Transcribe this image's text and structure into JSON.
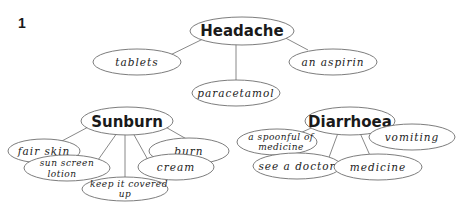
{
  "exercise_number": "1",
  "hubs": {
    "headache": {
      "label": "Headache",
      "leaves": [
        "tablets",
        "paracetamol",
        "an aspirin"
      ]
    },
    "sunburn": {
      "label": "Sunburn",
      "leaves": [
        "fair skin",
        "burn",
        "sun screen",
        "lotion",
        "cream",
        "keep it covered",
        "up"
      ]
    },
    "diarrhoea": {
      "label": "Diarrhoea",
      "leaves": [
        "a spoonful of",
        "medicine",
        "vomiting",
        "see a doctor",
        "medicine"
      ]
    }
  },
  "colors": {
    "stroke": "#6e6e6e",
    "text": "#1a1a1a",
    "background": "#ffffff"
  }
}
